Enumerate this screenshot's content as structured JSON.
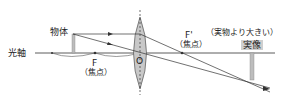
{
  "diagram": {
    "labels": {
      "optical_axis": "光軸",
      "object": "物体",
      "focal_point_F": "F",
      "focal_point_F_note": "（焦点）",
      "focal_point_F_prime": "F'",
      "focal_point_F_prime_note": "（焦点）",
      "lens_center": "O",
      "real_image": "実像",
      "image_note": "（実物より大きい）"
    },
    "colors": {
      "line": "#333333",
      "lens_fill": "#c8c8c8",
      "image_bar": "#bdbdbd",
      "object_bar": "#bdbdbd",
      "label_box": "#cfcfcf"
    }
  }
}
